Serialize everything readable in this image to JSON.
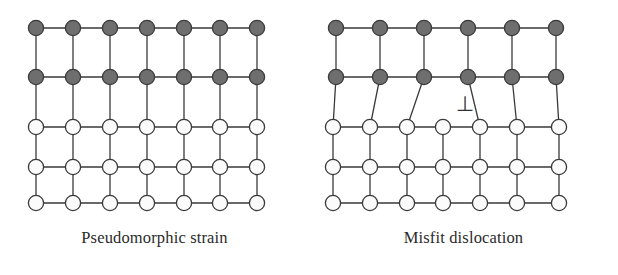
{
  "figure": {
    "type": "diagram",
    "background_color": "#ffffff"
  },
  "style": {
    "bond_color": "#3a3a3a",
    "bond_width": 1.3,
    "node_radius": 7.6,
    "node_stroke": "#3a3a3a",
    "node_stroke_width": 1.3,
    "overlayer_fill": "#6e6e6e",
    "substrate_fill": "#fbfbfb",
    "text_color": "#2b2b2b"
  },
  "panels": [
    {
      "id": "pseudomorphic",
      "caption": "Pseudomorphic strain",
      "description": "Coherent strained epilayer: overlayer rows are stretched laterally to match the substrate, every column is continuous, no dislocation present.",
      "columns": 7,
      "rows": 5,
      "overlayer_rows": 2,
      "substrate_rows": 3,
      "has_dislocation": false,
      "dislocation_symbol": "",
      "nodes": [
        {
          "row": 0,
          "kind": "overlayer",
          "x": [
            36,
            73,
            110,
            147,
            184,
            220,
            257
          ],
          "y": 28
        },
        {
          "row": 1,
          "kind": "overlayer",
          "x": [
            36,
            73,
            110,
            147,
            184,
            220,
            257
          ],
          "y": 77
        },
        {
          "row": 2,
          "kind": "substrate",
          "x": [
            36,
            73,
            110,
            147,
            184,
            220,
            257
          ],
          "y": 127
        },
        {
          "row": 3,
          "kind": "substrate",
          "x": [
            36,
            73,
            110,
            147,
            184,
            220,
            257
          ],
          "y": 167
        },
        {
          "row": 4,
          "kind": "substrate",
          "x": [
            36,
            73,
            110,
            147,
            184,
            220,
            257
          ],
          "y": 203
        }
      ]
    },
    {
      "id": "misfit",
      "caption": "Misfit dislocation",
      "description": "Relaxed epilayer: the top two overlayer rows contain only six atoms while the substrate rows contain seven, so one extra half-plane terminates at the interface and the bonds fan outward around the dislocation core.",
      "columns_overlayer": 6,
      "columns_substrate": 7,
      "rows": 5,
      "overlayer_rows": 2,
      "substrate_rows": 3,
      "has_dislocation": true,
      "dislocation_symbol": "⊥",
      "dislocation_symbol_position": {
        "x": 156,
        "y": 105
      },
      "nodes": [
        {
          "row": 0,
          "kind": "overlayer",
          "x": [
            27,
            71,
            115,
            159,
            203,
            247
          ],
          "y": 28
        },
        {
          "row": 1,
          "kind": "overlayer",
          "x": [
            27,
            71,
            115,
            159,
            203,
            247
          ],
          "y": 77
        },
        {
          "row": 2,
          "kind": "substrate",
          "x": [
            24,
            61,
            98,
            134,
            171,
            208,
            250
          ],
          "y": 127
        },
        {
          "row": 3,
          "kind": "substrate",
          "x": [
            24,
            61,
            98,
            134,
            171,
            208,
            250
          ],
          "y": 167
        },
        {
          "row": 4,
          "kind": "substrate",
          "x": [
            24,
            61,
            98,
            134,
            171,
            208,
            250
          ],
          "y": 203
        }
      ],
      "interface_bonds": [
        {
          "from": {
            "row": 1,
            "index": 0
          },
          "to": {
            "row": 2,
            "index": 0
          }
        },
        {
          "from": {
            "row": 1,
            "index": 1
          },
          "to": {
            "row": 2,
            "index": 1
          }
        },
        {
          "from": {
            "row": 1,
            "index": 2
          },
          "to": {
            "row": 2,
            "index": 2
          }
        },
        {
          "from": {
            "row": 1,
            "index": 3
          },
          "to": {
            "row": 2,
            "index": 4
          }
        },
        {
          "from": {
            "row": 1,
            "index": 4
          },
          "to": {
            "row": 2,
            "index": 5
          }
        },
        {
          "from": {
            "row": 1,
            "index": 5
          },
          "to": {
            "row": 2,
            "index": 6
          }
        }
      ]
    }
  ]
}
